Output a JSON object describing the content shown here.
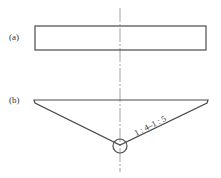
{
  "figure": {
    "parts": [
      {
        "label": "(a)",
        "shape": "rectangle",
        "description": "rectangular cross-section"
      },
      {
        "label": "(b)",
        "shape": "inverted-triangle",
        "description": "inverted triangular cross-section with pivot circle at apex",
        "slope_annotation": "1 : 4–1 : 5"
      }
    ],
    "centerline": "vertical chain line (axis of symmetry)",
    "colors": {
      "stroke": "#4a4a4a",
      "centerline": "#8a8a8a",
      "text": "#333333",
      "background": "#ffffff"
    }
  }
}
